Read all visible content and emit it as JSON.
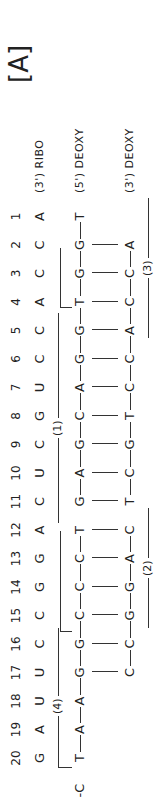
{
  "panel_label": "[A]",
  "positions": [
    "20",
    "19",
    "18",
    "17",
    "16",
    "15",
    "14",
    "13",
    "12",
    "11",
    "10",
    "9",
    "8",
    "7",
    "6",
    "5",
    "4",
    "3",
    "2",
    "1"
  ],
  "rna": {
    "label": "(3') RIBO",
    "bases": [
      "G",
      "A",
      "U",
      "U",
      "C",
      "C",
      "G",
      "G",
      "A",
      "C",
      "U",
      "C",
      "G",
      "U",
      "C",
      "C",
      "A",
      "C",
      "C",
      "A"
    ]
  },
  "dna_upper": {
    "label": "(5') DEOXY",
    "leading": "-C",
    "bases": [
      "T",
      "A",
      "A",
      "G",
      "G",
      "C",
      "C",
      "C",
      "T",
      "G",
      "A",
      "G",
      "C",
      "A",
      "G",
      "G",
      "T",
      "G",
      "G",
      "T"
    ]
  },
  "dna_lower": {
    "label": "(3') DEOXY",
    "bases": [
      "",
      "",
      "",
      "C",
      "C",
      "G",
      "G",
      "A",
      "C",
      "T",
      "C",
      "G",
      "T",
      "C",
      "C",
      "A",
      "C",
      "C",
      "A"
    ]
  },
  "segments": {
    "seg1": "(1)",
    "seg2": "(2)",
    "seg3": "(3)",
    "seg4": "(4)"
  }
}
